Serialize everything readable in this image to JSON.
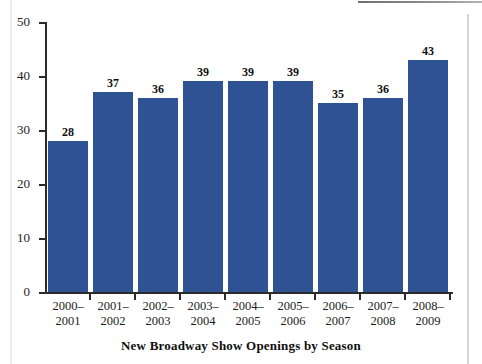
{
  "chart_data": {
    "type": "bar",
    "title": "New Broadway Show Openings by Season",
    "xlabel": "",
    "ylabel": "",
    "ylim": [
      0,
      50
    ],
    "yticks": [
      0,
      10,
      20,
      30,
      40,
      50
    ],
    "grid": false,
    "legend": null,
    "bar_color": "#2f5295",
    "categories": [
      "2000–\n2001",
      "2001–\n2002",
      "2002–\n2003",
      "2003–\n2004",
      "2004–\n2005",
      "2005–\n2006",
      "2006–\n2007",
      "2007–\n2008",
      "2008–\n2009"
    ],
    "category_lines": [
      [
        "2000–",
        "2001"
      ],
      [
        "2001–",
        "2002"
      ],
      [
        "2002–",
        "2003"
      ],
      [
        "2003–",
        "2004"
      ],
      [
        "2004–",
        "2005"
      ],
      [
        "2005–",
        "2006"
      ],
      [
        "2006–",
        "2007"
      ],
      [
        "2007–",
        "2008"
      ],
      [
        "2008–",
        "2009"
      ]
    ],
    "values": [
      28,
      37,
      36,
      39,
      39,
      39,
      35,
      36,
      43
    ],
    "value_labels": [
      "28",
      "37",
      "36",
      "39",
      "39",
      "39",
      "35",
      "36",
      "43"
    ],
    "ytick_labels": [
      "0",
      "10",
      "20",
      "30",
      "40",
      "50"
    ]
  }
}
